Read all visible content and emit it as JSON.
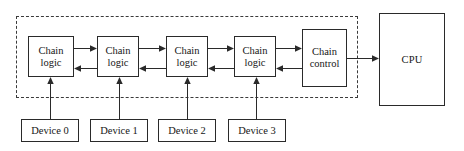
{
  "diagram": {
    "canvas": {
      "width": 464,
      "height": 151
    },
    "colors": {
      "background": "#ffffff",
      "box_stroke": "#2a2a2a",
      "dashed_stroke": "#3b3b3b",
      "text": "#161616"
    },
    "dashed_region": {
      "name": "bus-arbiter-boundary",
      "x": 16,
      "y": 16,
      "width": 342,
      "height": 82,
      "style": "dashed"
    },
    "chain_logic_nodes": [
      {
        "id": "chain-logic-0",
        "line1": "Chain",
        "line2": "logic",
        "x": 28,
        "y": 36,
        "width": 46,
        "height": 41
      },
      {
        "id": "chain-logic-1",
        "line1": "Chain",
        "line2": "logic",
        "x": 97,
        "y": 36,
        "width": 42,
        "height": 41
      },
      {
        "id": "chain-logic-2",
        "line1": "Chain",
        "line2": "logic",
        "x": 166,
        "y": 36,
        "width": 42,
        "height": 41
      },
      {
        "id": "chain-logic-3",
        "line1": "Chain",
        "line2": "logic",
        "x": 234,
        "y": 36,
        "width": 42,
        "height": 41
      }
    ],
    "chain_control": {
      "id": "chain-control",
      "line1": "Chain",
      "line2": "control",
      "x": 302,
      "y": 29,
      "width": 45,
      "height": 58
    },
    "cpu": {
      "id": "cpu",
      "label": "CPU",
      "x": 379,
      "y": 13,
      "width": 66,
      "height": 93
    },
    "devices": [
      {
        "id": "device-0",
        "label": "Device 0",
        "x": 21,
        "y": 119,
        "width": 58,
        "height": 23,
        "wire_x": 50
      },
      {
        "id": "device-1",
        "label": "Device 1",
        "x": 90,
        "y": 119,
        "width": 58,
        "height": 23,
        "wire_x": 119
      },
      {
        "id": "device-2",
        "label": "Device 2",
        "x": 158,
        "y": 119,
        "width": 58,
        "height": 23,
        "wire_x": 187
      },
      {
        "id": "device-3",
        "label": "Device 3",
        "x": 228,
        "y": 119,
        "width": 58,
        "height": 23,
        "wire_x": 256
      }
    ],
    "connections": [
      {
        "name": "grant-forward-0-to-1",
        "direction": "right",
        "from": "chain-logic-0",
        "to": "chain-logic-1",
        "y": 48
      },
      {
        "name": "request-back-1-to-0",
        "direction": "left",
        "from": "chain-logic-1",
        "to": "chain-logic-0",
        "y": 68
      },
      {
        "name": "grant-forward-1-to-2",
        "direction": "right",
        "from": "chain-logic-1",
        "to": "chain-logic-2",
        "y": 48
      },
      {
        "name": "request-back-2-to-1",
        "direction": "left",
        "from": "chain-logic-2",
        "to": "chain-logic-1",
        "y": 68
      },
      {
        "name": "grant-forward-2-to-3",
        "direction": "right",
        "from": "chain-logic-2",
        "to": "chain-logic-3",
        "y": 48
      },
      {
        "name": "request-back-3-to-2",
        "direction": "left",
        "from": "chain-logic-3",
        "to": "chain-logic-2",
        "y": 68
      },
      {
        "name": "grant-forward-3-to-control",
        "direction": "right",
        "from": "chain-logic-3",
        "to": "chain-control",
        "y": 48
      },
      {
        "name": "request-back-control-to-3",
        "direction": "left",
        "from": "chain-control",
        "to": "chain-logic-3",
        "y": 68
      },
      {
        "name": "control-to-cpu",
        "direction": "right",
        "from": "chain-control",
        "to": "cpu",
        "y": 58
      },
      {
        "name": "device-0-to-chain-logic-0",
        "direction": "up",
        "from": "device-0",
        "to": "chain-logic-0"
      },
      {
        "name": "device-1-to-chain-logic-1",
        "direction": "up",
        "from": "device-1",
        "to": "chain-logic-1"
      },
      {
        "name": "device-2-to-chain-logic-2",
        "direction": "up",
        "from": "device-2",
        "to": "chain-logic-2"
      },
      {
        "name": "device-3-to-chain-logic-3",
        "direction": "up",
        "from": "device-3",
        "to": "chain-logic-3"
      }
    ]
  }
}
